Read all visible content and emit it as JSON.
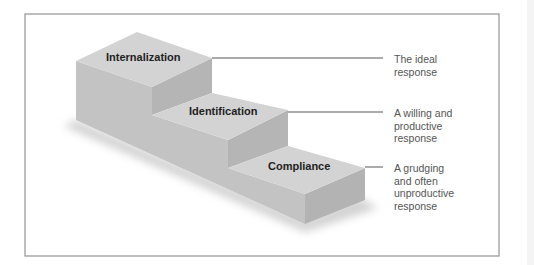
{
  "diagram": {
    "steps": [
      {
        "label": "Internalization",
        "description": [
          "The ideal",
          "response"
        ]
      },
      {
        "label": "Identification",
        "description": [
          "A willing and",
          "productive",
          "response"
        ]
      },
      {
        "label": "Compliance",
        "description": [
          "A grudging",
          "and often",
          "unproductive",
          "response"
        ]
      }
    ]
  }
}
